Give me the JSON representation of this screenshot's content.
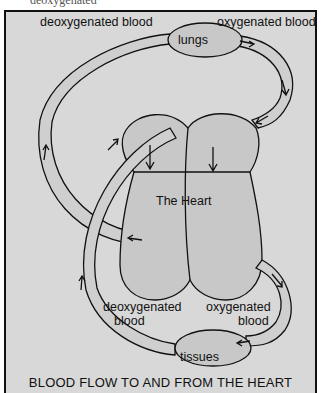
{
  "page_fragment": "deoxygenated",
  "diagram": {
    "title": "BLOOD FLOW TO AND FROM THE HEART",
    "labels": {
      "top_left": "deoxygenated blood",
      "top_right": "oxygenated blood",
      "lungs": "lungs",
      "heart": "The Heart",
      "bottom_left_1": "deoxygenated",
      "bottom_left_2": "blood",
      "bottom_right_1": "oxygenated",
      "bottom_right_2": "blood",
      "tissues": "tissues"
    },
    "colors": {
      "background": "#d8d8d8",
      "organ_fill": "#c8c8c8",
      "vessel_fill": "#cfcfcf",
      "stroke": "#111111"
    }
  }
}
